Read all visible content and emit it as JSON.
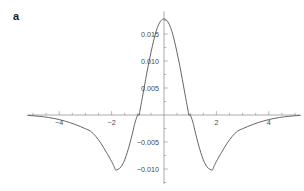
{
  "panel": {
    "label": "a"
  },
  "chart_data": {
    "type": "line",
    "title": "",
    "subtitle": "",
    "xlabel": "",
    "ylabel": "",
    "grid": false,
    "legend": null,
    "axis_style": "origin-crossing",
    "xlim": [
      -5.2,
      5.2
    ],
    "ylim": [
      -0.0128,
      0.0192
    ],
    "x_ticks_major": [
      -4,
      -2,
      2,
      4
    ],
    "x_tick_labels": [
      "-4",
      "-2",
      "2",
      "4"
    ],
    "x_ticks_minor": [
      -5,
      -4.5,
      -3.5,
      -3,
      -2.5,
      -1.5,
      -1,
      -0.5,
      0.5,
      1,
      1.5,
      2.5,
      3,
      3.5,
      4.5,
      5
    ],
    "y_ticks_major": [
      0.015,
      0.01,
      0.005,
      -0.005,
      -0.01
    ],
    "y_tick_labels": [
      "0.015",
      "0.010",
      "0.005",
      "-0.005",
      "-0.010"
    ],
    "y_ticks_minor": [
      0.0175,
      0.0125,
      0.0075,
      0.0025,
      -0.0025,
      -0.0075,
      -0.0125
    ],
    "peak_value": 0.0178,
    "peak_x": 0,
    "trough_value": -0.0102,
    "trough_x": [
      -1.85,
      1.85
    ],
    "zero_crossings": [
      -3.25,
      -0.95,
      0.95,
      3.25
    ],
    "colors": {
      "curve": "#555555",
      "axis": "#888888",
      "tick_label": "#4a4a4a",
      "panel_label": "#1a1a1a",
      "background": "#ffffff"
    },
    "series": [
      {
        "name": "curve",
        "x": [
          -5.2,
          -5.0,
          -4.8,
          -4.6,
          -4.4,
          -4.2,
          -4.0,
          -3.8,
          -3.6,
          -3.4,
          -3.2,
          -3.0,
          -2.8,
          -2.6,
          -2.4,
          -2.2,
          -2.0,
          -1.9,
          -1.85,
          -1.8,
          -1.7,
          -1.6,
          -1.5,
          -1.4,
          -1.3,
          -1.2,
          -1.1,
          -1.0,
          -0.95,
          -0.9,
          -0.8,
          -0.7,
          -0.6,
          -0.5,
          -0.4,
          -0.3,
          -0.2,
          -0.1,
          0.0,
          0.1,
          0.2,
          0.3,
          0.4,
          0.5,
          0.6,
          0.7,
          0.8,
          0.9,
          0.95,
          1.0,
          1.1,
          1.2,
          1.3,
          1.4,
          1.5,
          1.6,
          1.7,
          1.8,
          1.85,
          1.9,
          2.0,
          2.2,
          2.4,
          2.6,
          2.8,
          3.0,
          3.2,
          3.4,
          3.6,
          3.8,
          4.0,
          4.2,
          4.4,
          4.6,
          4.8,
          5.0,
          5.2
        ],
        "y": [
          -8e-05,
          -0.00014,
          -0.00022,
          -0.00033,
          -0.00047,
          -0.00064,
          -0.00085,
          -0.0011,
          -0.0014,
          -0.00174,
          -0.00212,
          -0.00254,
          -0.003,
          -0.00398,
          -0.0053,
          -0.0069,
          -0.0086,
          -0.0096,
          -0.0102,
          -0.01015,
          -0.0099,
          -0.0093,
          -0.0083,
          -0.0069,
          -0.0052,
          -0.0033,
          -0.0013,
          5e-05,
          0.0,
          0.0013,
          0.0039,
          0.0066,
          0.0092,
          0.0115,
          0.0137,
          0.0155,
          0.0168,
          0.01755,
          0.0178,
          0.01755,
          0.0168,
          0.0155,
          0.0137,
          0.0115,
          0.0092,
          0.0066,
          0.0039,
          0.0013,
          0.0,
          5e-05,
          -0.0013,
          -0.0033,
          -0.0052,
          -0.0069,
          -0.0083,
          -0.0093,
          -0.0099,
          -0.01015,
          -0.0102,
          -0.0096,
          -0.0086,
          -0.0069,
          -0.0053,
          -0.00398,
          -0.003,
          -0.00254,
          -0.00212,
          -0.00174,
          -0.0014,
          -0.0011,
          -0.00085,
          -0.00064,
          -0.00047,
          -0.00033,
          -0.00022,
          -0.00014,
          -8e-05
        ]
      }
    ]
  }
}
